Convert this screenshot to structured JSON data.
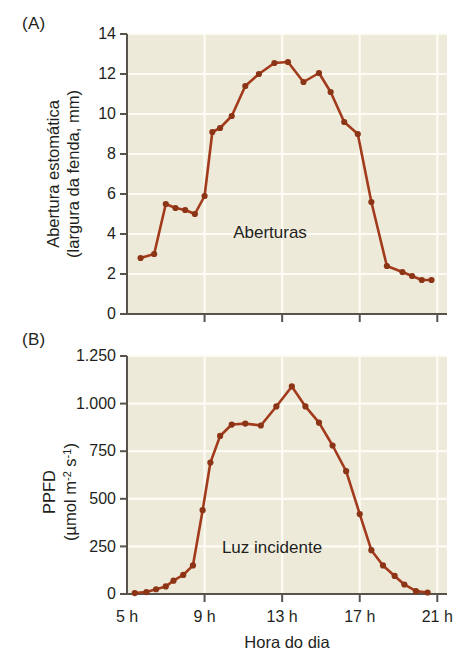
{
  "figure": {
    "panels": [
      {
        "id": "A",
        "label": "(A)",
        "annotation": "Aberturas"
      },
      {
        "id": "B",
        "label": "(B)",
        "annotation": "Luz incidente"
      }
    ],
    "xlabel": "Hora do dia",
    "accent_color": "#a23a1c",
    "point_color": "#8c3416",
    "plot_background": "#eeeada"
  },
  "chart_data": [
    {
      "type": "line",
      "panel": "A",
      "title": "",
      "annotation": "Aberturas",
      "xlabel": "Hora do dia",
      "ylabel": "Abertura estomática (largura da fenda, mm)",
      "ylabel_line1": "Abertura estomática",
      "ylabel_line2": "(largura da fenda, mm)",
      "xlim": [
        5,
        21.5
      ],
      "ylim": [
        0,
        14
      ],
      "yticks": [
        0,
        2,
        4,
        6,
        8,
        10,
        12,
        14
      ],
      "ytick_labels": [
        "0",
        "2",
        "4",
        "6",
        "8",
        "10",
        "12",
        "14"
      ],
      "xticks": [
        5,
        9,
        13,
        17,
        21
      ],
      "xtick_labels": [
        "5 h",
        "9 h",
        "13 h",
        "17 h",
        "21 h"
      ],
      "grid": true,
      "legend": "none",
      "x": [
        5.7,
        6.4,
        7.0,
        7.5,
        8.0,
        8.5,
        9.0,
        9.4,
        9.8,
        10.4,
        11.1,
        11.8,
        12.6,
        13.3,
        14.1,
        14.9,
        15.5,
        16.2,
        16.9,
        17.6,
        18.4,
        19.2,
        19.7,
        20.2,
        20.7
      ],
      "y": [
        2.8,
        3.0,
        5.5,
        5.3,
        5.2,
        5.0,
        5.9,
        9.1,
        9.3,
        9.9,
        11.4,
        12.0,
        12.55,
        12.6,
        11.6,
        12.05,
        11.1,
        9.6,
        9.0,
        5.6,
        2.4,
        2.1,
        1.9,
        1.7,
        1.7
      ]
    },
    {
      "type": "line",
      "panel": "B",
      "title": "",
      "annotation": "Luz incidente",
      "xlabel": "Hora do dia",
      "ylabel": "PPFD (µmol m-2 s-1)",
      "ylabel_line1": "PPFD",
      "ylabel_line2_prefix": "(µmol m",
      "ylabel_line2_sup1": "-2",
      "ylabel_line2_mid": " s",
      "ylabel_line2_sup2": "-1",
      "ylabel_line2_suffix": ")",
      "xlim": [
        5,
        21.5
      ],
      "ylim": [
        0,
        1250
      ],
      "yticks": [
        0,
        250,
        500,
        750,
        1000,
        1250
      ],
      "ytick_labels": [
        "0",
        "250",
        "500",
        "750",
        "1.000",
        "1.250"
      ],
      "xticks": [
        5,
        9,
        13,
        17,
        21
      ],
      "xtick_labels": [
        "5 h",
        "9 h",
        "13 h",
        "17 h",
        "21 h"
      ],
      "grid": true,
      "legend": "none",
      "x": [
        5.4,
        6.0,
        6.5,
        7.0,
        7.4,
        7.9,
        8.4,
        8.9,
        9.3,
        9.8,
        10.4,
        11.1,
        11.9,
        12.7,
        13.5,
        14.2,
        14.9,
        15.6,
        16.3,
        17.0,
        17.6,
        18.2,
        18.8,
        19.3,
        19.9,
        20.5
      ],
      "y": [
        5,
        10,
        25,
        40,
        70,
        100,
        150,
        440,
        690,
        830,
        890,
        895,
        885,
        985,
        1090,
        985,
        900,
        780,
        645,
        420,
        230,
        150,
        95,
        50,
        15,
        8
      ]
    }
  ]
}
